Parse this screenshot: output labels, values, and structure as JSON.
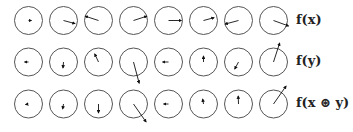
{
  "figure": {
    "type": "phasor-grid",
    "stroke_color": "#555555",
    "arrow_color": "#111111",
    "circle_radius": 14,
    "columns": 8,
    "col_x": [
      28.5,
      63.5,
      98.5,
      133.5,
      168.5,
      203.5,
      238.5,
      273.5
    ],
    "rows": [
      {
        "label": "f(x)",
        "y": 20.5,
        "label_y": 26,
        "arrows": [
          {
            "angle": 0,
            "length": 3
          },
          {
            "angle": 15,
            "length": 12
          },
          {
            "angle": -162,
            "length": 14
          },
          {
            "angle": -18,
            "length": 14
          },
          {
            "angle": 0,
            "length": 13
          },
          {
            "angle": -15,
            "length": 11
          },
          {
            "angle": 165,
            "length": 14
          },
          {
            "angle": 20,
            "length": 16
          }
        ]
      },
      {
        "label": "f(y)",
        "y": 62,
        "label_y": 67,
        "arrows": [
          {
            "angle": 180,
            "length": 4
          },
          {
            "angle": 95,
            "length": 6
          },
          {
            "angle": -115,
            "length": 9
          },
          {
            "angle": 75,
            "length": 22
          },
          {
            "angle": 180,
            "length": 6
          },
          {
            "angle": -90,
            "length": 6
          },
          {
            "angle": 118,
            "length": 8
          },
          {
            "angle": -72,
            "length": 20
          }
        ]
      },
      {
        "label": "f(x ⊛ y)",
        "y": 104,
        "label_y": 109,
        "arrows": [
          {
            "angle": 170,
            "length": 3
          },
          {
            "angle": 100,
            "length": 5
          },
          {
            "angle": 90,
            "length": 9
          },
          {
            "angle": 55,
            "length": 22
          },
          {
            "angle": 180,
            "length": 5
          },
          {
            "angle": -100,
            "length": 5
          },
          {
            "angle": -92,
            "length": 8
          },
          {
            "angle": -55,
            "length": 22
          }
        ]
      }
    ]
  }
}
